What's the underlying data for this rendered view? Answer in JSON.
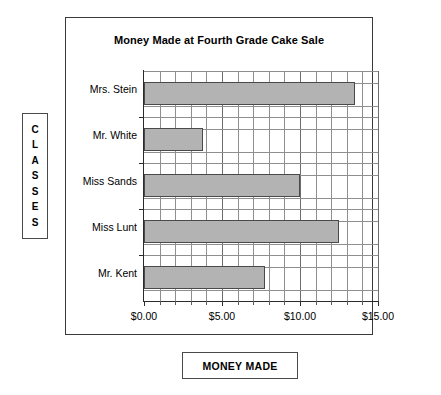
{
  "chart_data": {
    "type": "bar",
    "orientation": "horizontal",
    "title": "Money Made at Fourth Grade Cake Sale",
    "xlabel": "MONEY MADE",
    "ylabel": "CLASSES",
    "categories": [
      "Mrs. Stein",
      "Mr. White",
      "Miss Sands",
      "Miss Lunt",
      "Mr. Kent"
    ],
    "values": [
      13.5,
      3.75,
      10.0,
      12.5,
      7.75
    ],
    "xlim": [
      0,
      15
    ],
    "x_tick_labels": [
      "$0.00",
      "$5.00",
      "$10.00",
      "$15.00"
    ],
    "x_tick_values": [
      0,
      5,
      10,
      15
    ],
    "x_minor_tick_step": 1,
    "grid": true,
    "legend": null,
    "bar_fill_color": "#b3b3b3",
    "bar_border_color": "#4a4a4a",
    "grid_color": "#8f8f8f",
    "axis_color": "#2b2b2b",
    "frame_color": "#3a3a3a"
  },
  "axis_titles": {
    "y_letters": [
      "C",
      "L",
      "A",
      "S",
      "S",
      "E",
      "S"
    ],
    "x_text": "MONEY MADE"
  }
}
